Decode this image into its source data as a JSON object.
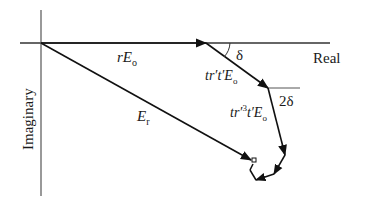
{
  "diagram": {
    "type": "phasor-diagram",
    "axes": {
      "real_label": "Real",
      "imaginary_label": "Imaginary"
    },
    "phasors": [
      {
        "id": "r-e0",
        "label_main": "rE",
        "label_sub": "o"
      },
      {
        "id": "tr-t-e0",
        "label_main": "tr′t′E",
        "label_sub": "o"
      },
      {
        "id": "tr3-t-e0",
        "label_main": "tr′",
        "label_sup": "3",
        "label_tail": "t′E",
        "label_sub": "o"
      },
      {
        "id": "e-r",
        "label_main": "E",
        "label_sub": "r"
      }
    ],
    "angles": [
      {
        "id": "delta",
        "label": "δ"
      },
      {
        "id": "two-delta",
        "label": "2δ"
      }
    ],
    "colors": {
      "line": "#1a1a1a",
      "axis": "#555555"
    }
  }
}
